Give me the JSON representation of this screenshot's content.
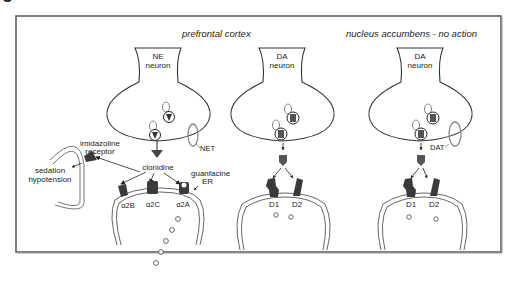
{
  "figure": {
    "caption_fragment": "g",
    "regions": {
      "left": "prefrontal cortex",
      "right": "nucleus accumbens - no action"
    },
    "neurons": [
      {
        "id": "ne",
        "label_line1": "NE",
        "label_line2": "neuron",
        "transporter": "NET"
      },
      {
        "id": "da_pfc",
        "label_line1": "DA",
        "label_line2": "neuron"
      },
      {
        "id": "da_nac",
        "label_line1": "DA",
        "label_line2": "neuron",
        "transporter": "DAT"
      }
    ],
    "left_labels": {
      "imidazoline_line1": "imidazoline",
      "imidazoline_line2": "receptor",
      "sedation": "sedation",
      "hypotension": "hypotension"
    },
    "drugs": {
      "clonidine": "clonidine",
      "guanfacine_line1": "guanfacine",
      "guanfacine_line2": "ER"
    },
    "ne_receptors": [
      "α2B",
      "α2C",
      "α2A"
    ],
    "da_receptors_pfc": [
      "D1",
      "D2"
    ],
    "da_receptors_nac": [
      "D1",
      "D2"
    ]
  },
  "colors": {
    "frame": "#555555",
    "receptor": "#3a3a3a",
    "outline": "#333333",
    "membrane": "#666666",
    "transporter": "#888888"
  }
}
